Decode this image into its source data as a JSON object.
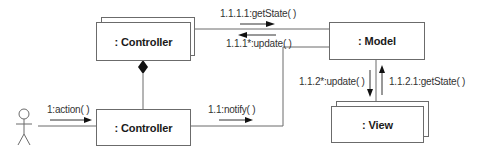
{
  "diagram": {
    "type": "uml-collaboration-diagram",
    "colors": {
      "line": "#6b6b6b",
      "text": "#1a1a1a",
      "message_text": "#333333",
      "arrow": "#111111",
      "background": "#ffffff"
    },
    "actor": {
      "name": "actor-stick-figure",
      "icon": "stick-figure-icon"
    },
    "objects": {
      "controller_top": {
        "label": ": Controller",
        "multi": true
      },
      "controller_bottom": {
        "label": ": Controller",
        "multi": false
      },
      "model": {
        "label": ": Model",
        "multi": false
      },
      "view": {
        "label": ": View",
        "multi": true
      }
    },
    "messages": {
      "action": {
        "label": "1:action( )",
        "direction": "right"
      },
      "notify": {
        "label": "1.1:notify( )",
        "direction": "right"
      },
      "get_state_controller": {
        "label": "1.1.1.1:getState( )",
        "direction": "right"
      },
      "update_controller": {
        "label": "1.1.1*:update( )",
        "direction": "left"
      },
      "update_view": {
        "label": "1.1.2*:update( )",
        "direction": "down"
      },
      "get_state_view": {
        "label": "1.1.2.1:getState( )",
        "direction": "up"
      }
    },
    "relations": [
      {
        "from": "controller_top",
        "to": "controller_bottom",
        "kind": "composition"
      },
      {
        "from": "actor",
        "to": "controller_bottom",
        "kind": "link"
      },
      {
        "from": "controller_top",
        "to": "model",
        "kind": "link"
      },
      {
        "from": "controller_bottom",
        "to": "model",
        "kind": "link"
      },
      {
        "from": "model",
        "to": "view",
        "kind": "link"
      }
    ]
  }
}
